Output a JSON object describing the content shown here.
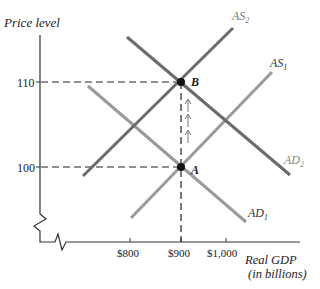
{
  "diagram": {
    "type": "AD-AS model",
    "y_axis_label": "Price level",
    "x_axis_label_line1": "Real GDP",
    "x_axis_label_line2": "(in billions)",
    "y_ticks": [
      {
        "label": "110",
        "y": 82
      },
      {
        "label": "100",
        "y": 167
      }
    ],
    "x_ticks": [
      {
        "label": "$800",
        "x": 130
      },
      {
        "label": "$900",
        "x": 181
      },
      {
        "label": "$1,000",
        "x": 226
      }
    ],
    "curves": [
      {
        "name": "AS2",
        "label_main": "AS",
        "label_sub": "2",
        "color": "#6b6b6b"
      },
      {
        "name": "AS1",
        "label_main": "AS",
        "label_sub": "1",
        "color": "#9a9a9a"
      },
      {
        "name": "AD2",
        "label_main": "AD",
        "label_sub": "2",
        "color": "#6b6b6b"
      },
      {
        "name": "AD1",
        "label_main": "AD",
        "label_sub": "1",
        "color": "#9a9a9a"
      }
    ],
    "points": [
      {
        "label": "A",
        "price": 100,
        "gdp": "$900"
      },
      {
        "label": "B",
        "price": 110,
        "gdp": "$900"
      }
    ],
    "arrows_direction": "up",
    "arrow_count": 3
  }
}
